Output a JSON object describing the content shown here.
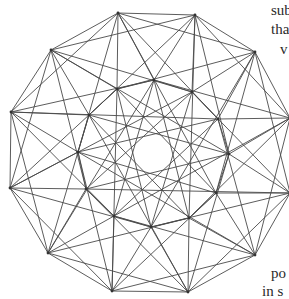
{
  "figure": {
    "type": "geometric-graph",
    "line_color": "#4a4a4a",
    "vertex_color": "#333333",
    "outer_vertices": [
      [
        118,
        13
      ],
      [
        195,
        15
      ],
      [
        255,
        52
      ],
      [
        290,
        118
      ],
      [
        290,
        193
      ],
      [
        255,
        255
      ],
      [
        188,
        292
      ],
      [
        112,
        291
      ],
      [
        48,
        253
      ],
      [
        10,
        188
      ],
      [
        11,
        112
      ],
      [
        51,
        50
      ]
    ],
    "inner_vertices": [
      [
        154,
        80
      ],
      [
        192,
        92
      ],
      [
        218,
        119
      ],
      [
        229,
        154
      ],
      [
        216,
        193
      ],
      [
        189,
        218
      ],
      [
        151,
        227
      ],
      [
        114,
        216
      ],
      [
        86,
        189
      ],
      [
        78,
        152
      ],
      [
        89,
        115
      ],
      [
        117,
        89
      ]
    ],
    "center_hole": {
      "cx": 153,
      "cy": 153,
      "r": 20
    }
  },
  "side_text": {
    "line1": "sub",
    "line2": "tha",
    "line3": "v",
    "line4": "po",
    "line5": "in s"
  }
}
